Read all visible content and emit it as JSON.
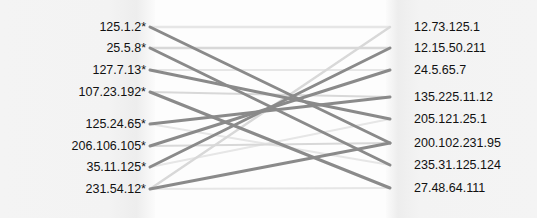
{
  "diagram": {
    "type": "bipartite-graph",
    "title": "",
    "background_color": "#fdfdfd",
    "panel_color": "#f2f2f2",
    "left_axis_x": 150,
    "right_axis_x": 390,
    "left_nodes": [
      {
        "label": "125.1.2*",
        "y": 27
      },
      {
        "label": "25.5.8*",
        "y": 48
      },
      {
        "label": "127.7.13*",
        "y": 70
      },
      {
        "label": "107.23.192*",
        "y": 92
      },
      {
        "label": "125.24.65*",
        "y": 124
      },
      {
        "label": "206.106.105*",
        "y": 146
      },
      {
        "label": "35.11.125*",
        "y": 167
      },
      {
        "label": "231.54.12*",
        "y": 189
      }
    ],
    "right_nodes": [
      {
        "label": "12.73.125.1",
        "y": 27
      },
      {
        "label": "12.15.50.211",
        "y": 48
      },
      {
        "label": "24.5.65.7",
        "y": 70
      },
      {
        "label": "135.225.11.12",
        "y": 97
      },
      {
        "label": "205.121.25.1",
        "y": 119
      },
      {
        "label": "200.102.231.95",
        "y": 143
      },
      {
        "label": "235.31.125.124",
        "y": 165
      },
      {
        "label": "27.48.64.111",
        "y": 188
      }
    ],
    "edge_colors": {
      "strong": "#8a8a8a",
      "medium": "#b4b4b4",
      "weak": "#d8d8d8",
      "faint": "#e6e6e6"
    },
    "edges": [
      {
        "from": 0,
        "to": 5,
        "weight": "strong",
        "width": 3.0
      },
      {
        "from": 0,
        "to": 0,
        "weight": "faint",
        "width": 2.4
      },
      {
        "from": 1,
        "to": 6,
        "weight": "strong",
        "width": 3.0
      },
      {
        "from": 1,
        "to": 1,
        "weight": "weak",
        "width": 2.4
      },
      {
        "from": 2,
        "to": 4,
        "weight": "strong",
        "width": 3.0
      },
      {
        "from": 2,
        "to": 2,
        "weight": "faint",
        "width": 2.2
      },
      {
        "from": 3,
        "to": 7,
        "weight": "strong",
        "width": 3.0
      },
      {
        "from": 3,
        "to": 3,
        "weight": "weak",
        "width": 2.2
      },
      {
        "from": 4,
        "to": 3,
        "weight": "strong",
        "width": 3.0
      },
      {
        "from": 4,
        "to": 6,
        "weight": "faint",
        "width": 2.2
      },
      {
        "from": 5,
        "to": 2,
        "weight": "strong",
        "width": 3.0
      },
      {
        "from": 5,
        "to": 5,
        "weight": "weak",
        "width": 2.2
      },
      {
        "from": 6,
        "to": 1,
        "weight": "strong",
        "width": 3.0
      },
      {
        "from": 6,
        "to": 4,
        "weight": "faint",
        "width": 2.2
      },
      {
        "from": 7,
        "to": 0,
        "weight": "weak",
        "width": 2.4
      },
      {
        "from": 7,
        "to": 5,
        "weight": "strong",
        "width": 3.0
      },
      {
        "from": 7,
        "to": 7,
        "weight": "faint",
        "width": 2.2
      }
    ]
  }
}
